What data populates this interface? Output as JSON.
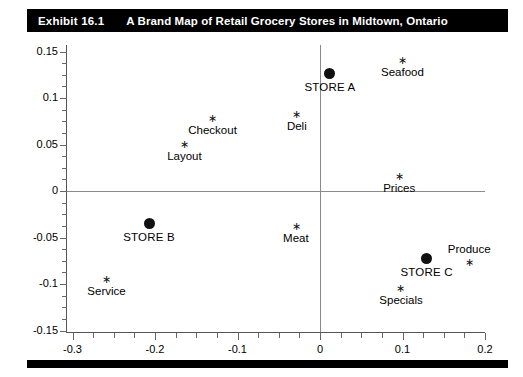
{
  "exhibit": {
    "number": "Exhibit 16.1",
    "title": "A Brand Map of Retail Grocery Stores in Midtown, Ontario"
  },
  "chart_data": {
    "type": "scatter",
    "title": "A Brand Map of Retail Grocery Stores in Midtown, Ontario",
    "xlabel": "",
    "ylabel": "",
    "xlim": [
      -0.3,
      0.2
    ],
    "ylim": [
      -0.15,
      0.15
    ],
    "xticks": [
      "-0.3",
      "-0.2",
      "-0.1",
      "0",
      "0.1",
      "0.2"
    ],
    "xtick_values": [
      -0.3,
      -0.2,
      -0.1,
      0,
      0.1,
      0.2
    ],
    "yticks": [
      "0.15",
      "0.1",
      "0.05",
      "0",
      "-0.05",
      "-0.1",
      "-0.15"
    ],
    "ytick_values": [
      0.15,
      0.1,
      0.05,
      0,
      -0.05,
      -0.1,
      -0.15
    ],
    "grid": false,
    "zero_lines": true,
    "legend": "none",
    "series": [
      {
        "name": "Stores",
        "marker": "filled-circle",
        "points": [
          {
            "label": "STORE A",
            "x": 0.012,
            "y": 0.126,
            "label_pos": "below"
          },
          {
            "label": "STORE B",
            "x": -0.207,
            "y": -0.035,
            "label_pos": "below"
          },
          {
            "label": "STORE C",
            "x": 0.129,
            "y": -0.073,
            "label_pos": "below"
          }
        ]
      },
      {
        "name": "Attributes",
        "marker": "asterisk",
        "points": [
          {
            "label": "Seafood",
            "x": 0.1,
            "y": 0.139,
            "label_pos": "below"
          },
          {
            "label": "Deli",
            "x": -0.028,
            "y": 0.081,
            "label_pos": "below"
          },
          {
            "label": "Checkout",
            "x": -0.13,
            "y": 0.076,
            "label_pos": "below"
          },
          {
            "label": "Layout",
            "x": -0.164,
            "y": 0.048,
            "label_pos": "below"
          },
          {
            "label": "Prices",
            "x": 0.096,
            "y": 0.014,
            "label_pos": "below"
          },
          {
            "label": "Meat",
            "x": -0.029,
            "y": -0.04,
            "label_pos": "below"
          },
          {
            "label": "Produce",
            "x": 0.181,
            "y": -0.079,
            "label_pos": "above"
          },
          {
            "label": "Specials",
            "x": 0.098,
            "y": -0.106,
            "label_pos": "below"
          },
          {
            "label": "Service",
            "x": -0.259,
            "y": -0.097,
            "label_pos": "below"
          }
        ]
      }
    ]
  },
  "marker_glyph": "∗"
}
